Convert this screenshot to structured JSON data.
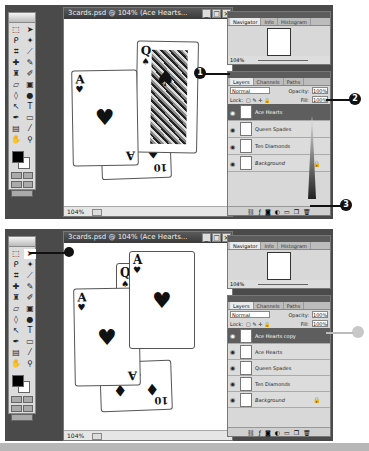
{
  "panels": [
    {
      "document": {
        "title": "3cards.psd @ 104% (Ace Hearts...",
        "zoom": "104%",
        "window_buttons": [
          "_",
          "□",
          "×"
        ]
      },
      "navigator": {
        "tabs": [
          "Navigator",
          "Info",
          "Histogram"
        ],
        "zoom": "104%"
      },
      "layers": {
        "tabs": [
          "Layers",
          "Channels",
          "Paths"
        ],
        "blend_mode": "Normal",
        "opacity_label": "Opacity:",
        "opacity": "100%",
        "lock_label": "Lock:",
        "fill_label": "Fill:",
        "fill": "100%",
        "items": [
          {
            "name": "Ace Hearts",
            "selected": true
          },
          {
            "name": "Queen Spades",
            "selected": false
          },
          {
            "name": "Ten Diamonds",
            "selected": false
          },
          {
            "name": "Background",
            "selected": false,
            "locked": true
          }
        ]
      },
      "callouts": [
        "1",
        "2",
        "3"
      ]
    },
    {
      "document": {
        "title": "3cards.psd @ 104% (Ace Hearts...",
        "zoom": "104%",
        "window_buttons": [
          "_",
          "□",
          "×"
        ]
      },
      "navigator": {
        "tabs": [
          "Navigator",
          "Info",
          "Histogram"
        ],
        "zoom": "104%"
      },
      "layers": {
        "tabs": [
          "Layers",
          "Channels",
          "Paths"
        ],
        "blend_mode": "Normal",
        "opacity_label": "Opacity:",
        "opacity": "100%",
        "lock_label": "Lock:",
        "fill_label": "Fill:",
        "fill": "100%",
        "items": [
          {
            "name": "Ace Hearts copy",
            "selected": true
          },
          {
            "name": "Ace Hearts",
            "selected": false
          },
          {
            "name": "Queen Spades",
            "selected": false
          },
          {
            "name": "Ten Diamonds",
            "selected": false
          },
          {
            "name": "Background",
            "selected": false,
            "locked": true
          }
        ]
      }
    }
  ],
  "cards": {
    "ace_rank": "A",
    "queen_rank": "Q",
    "ten_rank": "10",
    "heart": "♥",
    "spade": "♠",
    "diamond": "♦"
  },
  "icons": {
    "eye": "eye-icon",
    "lock": "lock-icon",
    "tools": [
      "marquee",
      "move",
      "lasso",
      "magic-wand",
      "crop",
      "slice",
      "healing",
      "brush",
      "stamp",
      "history-brush",
      "eraser",
      "gradient",
      "blur",
      "dodge",
      "path-select",
      "type",
      "pen",
      "shape",
      "notes",
      "eyedropper",
      "hand",
      "zoom"
    ]
  },
  "colors": {
    "app_bg": "#4a4a4a",
    "selected_layer": "#5e5e5e",
    "panel_bg": "#d8d8d8",
    "callout": "#111111"
  }
}
